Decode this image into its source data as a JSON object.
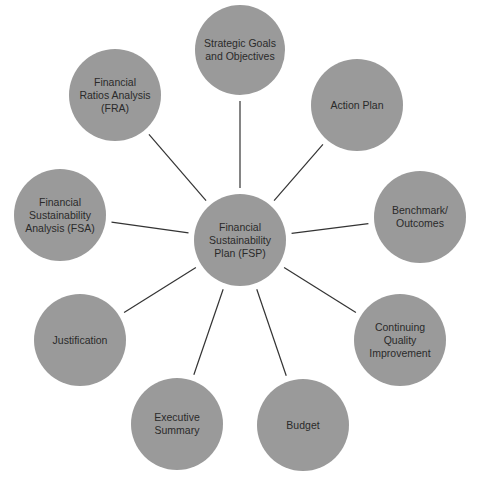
{
  "diagram": {
    "type": "hub-and-spoke",
    "center": {
      "label": "Financial\nSustainability\nPlan (FSP)",
      "x": 240,
      "y": 240,
      "r": 46
    },
    "nodes": [
      {
        "id": "strategic-goals",
        "label": "Strategic Goals\nand Objectives",
        "x": 240,
        "y": 50,
        "r": 45
      },
      {
        "id": "action-plan",
        "label": "Action Plan",
        "x": 357,
        "y": 105,
        "r": 46
      },
      {
        "id": "benchmark",
        "label": "Benchmark/\nOutcomes",
        "x": 420,
        "y": 217,
        "r": 46
      },
      {
        "id": "cqi",
        "label": "Continuing\nQuality\nImprovement",
        "x": 400,
        "y": 340,
        "r": 46
      },
      {
        "id": "budget",
        "label": "Budget",
        "x": 303,
        "y": 425,
        "r": 46
      },
      {
        "id": "executive-summary",
        "label": "Executive\nSummary",
        "x": 177,
        "y": 424,
        "r": 46
      },
      {
        "id": "justification",
        "label": "Justification",
        "x": 80,
        "y": 340,
        "r": 46
      },
      {
        "id": "fsa",
        "label": "Financial\nSustainability\nAnalysis (FSA)",
        "x": 60,
        "y": 215,
        "r": 46
      },
      {
        "id": "fra",
        "label": "Financial\nRatios Analysis\n(FRA)",
        "x": 115,
        "y": 95,
        "r": 46
      }
    ],
    "colors": {
      "node_fill": "#9a9a9a",
      "line": "#333333",
      "text": "#2a2a2a"
    }
  }
}
